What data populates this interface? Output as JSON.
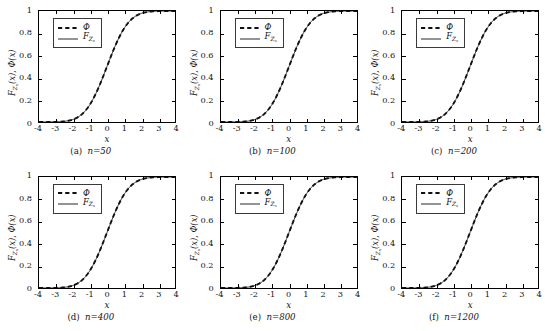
{
  "figure": {
    "background": "#ffffff",
    "rows": 2,
    "cols": 3,
    "line_color": "#111111",
    "axis_color": "#000000"
  },
  "axis": {
    "xlabel": "x",
    "ylabel_parts": {
      "f": "F",
      "fsub": "Z",
      "fsubsub": "n",
      "fvar": "(x),",
      "phi": "Φ",
      "phivar": "(x)"
    },
    "ylabel_plain": "F_{Z_n}(x), Φ(x)",
    "xticks": [
      "-4",
      "-3",
      "-2",
      "-1",
      "0",
      "1",
      "2",
      "3",
      "4"
    ],
    "xtick_values": [
      -4,
      -3,
      -2,
      -1,
      0,
      1,
      2,
      3,
      4
    ],
    "yticks": [
      "0",
      "0.2",
      "0.4",
      "0.6",
      "0.8",
      "1"
    ],
    "ytick_values": [
      0,
      0.2,
      0.4,
      0.6,
      0.8,
      1
    ],
    "xlim": [
      -4,
      4
    ],
    "ylim": [
      0,
      1
    ],
    "grid": false,
    "tick_direction": "in"
  },
  "legend": {
    "position": "upper-left",
    "entries": [
      {
        "label": "Φ",
        "style": "dashed",
        "name": "phi"
      },
      {
        "label_f": "F",
        "label_sub": "Z",
        "label_subsub": "n",
        "style": "solid",
        "name": "empirical-cdf"
      }
    ]
  },
  "panels": [
    {
      "id": "a",
      "caption_num": "(a)",
      "caption_n": "n=50",
      "n": 50
    },
    {
      "id": "b",
      "caption_num": "(b)",
      "caption_n": "n=100",
      "n": 100
    },
    {
      "id": "c",
      "caption_num": "(c)",
      "caption_n": "n=200",
      "n": 200
    },
    {
      "id": "d",
      "caption_num": "(d)",
      "caption_n": "n=400",
      "n": 400
    },
    {
      "id": "e",
      "caption_num": "(e)",
      "caption_n": "n=800",
      "n": 800
    },
    {
      "id": "f",
      "caption_num": "(f)",
      "caption_n": "n=1200",
      "n": 1200
    }
  ],
  "chart_data": {
    "type": "line",
    "title": "",
    "xlabel": "x",
    "ylabel": "F_{Z_n}(x), Φ(x)",
    "xlim": [
      -4,
      4
    ],
    "ylim": [
      0,
      1
    ],
    "grid": false,
    "legend_position": "upper-left",
    "x": [
      -4,
      -3.8,
      -3.6,
      -3.4,
      -3.2,
      -3,
      -2.8,
      -2.6,
      -2.4,
      -2.2,
      -2,
      -1.8,
      -1.6,
      -1.4,
      -1.2,
      -1,
      -0.8,
      -0.6,
      -0.4,
      -0.2,
      0,
      0.2,
      0.4,
      0.6,
      0.8,
      1,
      1.2,
      1.4,
      1.6,
      1.8,
      2,
      2.2,
      2.4,
      2.6,
      2.8,
      3,
      3.2,
      3.4,
      3.6,
      3.8,
      4
    ],
    "series": [
      {
        "name": "Φ",
        "style": "dashed",
        "values": [
          0.0,
          0.0,
          0.0,
          0.0,
          0.001,
          0.001,
          0.003,
          0.005,
          0.008,
          0.014,
          0.023,
          0.036,
          0.055,
          0.081,
          0.115,
          0.159,
          0.212,
          0.274,
          0.345,
          0.421,
          0.5,
          0.579,
          0.655,
          0.726,
          0.788,
          0.841,
          0.885,
          0.919,
          0.945,
          0.964,
          0.977,
          0.986,
          0.992,
          0.995,
          0.997,
          0.999,
          0.999,
          1.0,
          1.0,
          1.0,
          1.0
        ]
      },
      {
        "name": "F_{Z_n}",
        "style": "solid",
        "values": [
          0.0,
          0.0,
          0.0,
          0.0,
          0.001,
          0.001,
          0.003,
          0.005,
          0.008,
          0.014,
          0.023,
          0.036,
          0.055,
          0.081,
          0.115,
          0.159,
          0.212,
          0.274,
          0.345,
          0.421,
          0.5,
          0.579,
          0.655,
          0.726,
          0.788,
          0.841,
          0.885,
          0.919,
          0.945,
          0.964,
          0.977,
          0.986,
          0.992,
          0.995,
          0.997,
          0.999,
          0.999,
          1.0,
          1.0,
          1.0,
          1.0
        ]
      }
    ],
    "panel_captions": [
      "(a) n=50",
      "(b) n=100",
      "(c) n=200",
      "(d) n=400",
      "(e) n=800",
      "(f) n=1200"
    ]
  }
}
